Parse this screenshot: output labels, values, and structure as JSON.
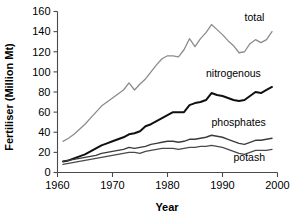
{
  "chart_data": {
    "type": "line",
    "title": "",
    "xlabel": "Year",
    "ylabel": "Fertiliser (Million Mt)",
    "xlim": [
      1960,
      2000
    ],
    "ylim": [
      0,
      160
    ],
    "xticks": [
      1960,
      1970,
      1980,
      1990,
      2000
    ],
    "yticks": [
      0,
      20,
      40,
      60,
      80,
      100,
      120,
      140,
      160
    ],
    "grid": false,
    "legend_position": "inline-end-labels",
    "x": [
      1961,
      1962,
      1963,
      1964,
      1965,
      1966,
      1967,
      1968,
      1969,
      1970,
      1971,
      1972,
      1973,
      1974,
      1975,
      1976,
      1977,
      1978,
      1979,
      1980,
      1981,
      1982,
      1983,
      1984,
      1985,
      1986,
      1987,
      1988,
      1989,
      1990,
      1991,
      1992,
      1993,
      1994,
      1995,
      1996,
      1997,
      1998,
      1999
    ],
    "series": [
      {
        "name": "total",
        "color": "#8c8c8c",
        "width": 1.3,
        "label": "total",
        "label_value": 140,
        "values": [
          31,
          34,
          38,
          43,
          48,
          54,
          60,
          66,
          70,
          74,
          78,
          82,
          89,
          82,
          88,
          93,
          100,
          107,
          113,
          116,
          116,
          115,
          122,
          133,
          125,
          133,
          139,
          147,
          142,
          137,
          131,
          126,
          119,
          120,
          128,
          132,
          129,
          132,
          140
        ]
      },
      {
        "name": "nitrogenous",
        "color": "#101010",
        "width": 2.0,
        "label": "nitrogenous",
        "label_value": 85,
        "values": [
          11,
          12,
          14,
          16,
          18,
          21,
          24,
          27,
          29,
          31,
          33,
          35,
          38,
          39,
          41,
          46,
          48,
          51,
          54,
          57,
          60,
          60,
          60,
          67,
          69,
          70,
          72,
          79,
          77,
          76,
          74,
          72,
          71,
          72,
          76,
          80,
          79,
          82,
          85
        ]
      },
      {
        "name": "phosphates",
        "color": "#3b3b3b",
        "width": 1.4,
        "label": "phosphates",
        "label_value": 34,
        "values": [
          11,
          12,
          13,
          14,
          15,
          16,
          17,
          19,
          20,
          21,
          22,
          23,
          25,
          24,
          25,
          26,
          28,
          29,
          30,
          31,
          31,
          30,
          31,
          33,
          33,
          34,
          35,
          37,
          36,
          35,
          33,
          31,
          29,
          28,
          30,
          32,
          32,
          33,
          34
        ]
      },
      {
        "name": "potash",
        "color": "#4a4a4a",
        "width": 1.3,
        "label": "potash",
        "label_value": 23,
        "values": [
          8,
          9,
          10,
          11,
          12,
          13,
          14,
          15,
          16,
          17,
          18,
          19,
          20,
          20,
          19,
          21,
          22,
          23,
          24,
          24,
          24,
          23,
          24,
          25,
          25,
          26,
          26,
          27,
          26,
          25,
          23,
          21,
          19,
          18,
          20,
          22,
          22,
          22,
          23
        ]
      }
    ],
    "annotations": [
      {
        "text": "total",
        "x": 1994,
        "y": 151
      },
      {
        "text": "nitrogenous",
        "x": 1987,
        "y": 95
      },
      {
        "text": "phosphates",
        "x": 1988,
        "y": 46
      },
      {
        "text": "potash",
        "x": 1992,
        "y": 11
      }
    ]
  }
}
